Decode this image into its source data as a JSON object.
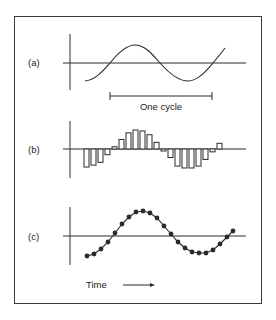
{
  "panels": {
    "a": {
      "label": "(a)",
      "description": "continuous sine wave"
    },
    "b": {
      "label": "(b)",
      "description": "sampled values as bars"
    },
    "c": {
      "label": "(c)",
      "description": "sampled values as dots on curve"
    }
  },
  "annotations": {
    "cycle_label": "One cycle",
    "time_label": "Time"
  },
  "colors": {
    "ink": "#2a2a2a",
    "frame": "#3a3a3a",
    "background": "#ffffff"
  },
  "bars_b": [
    -0.95,
    -0.85,
    -0.7,
    -0.3,
    0.12,
    0.5,
    0.85,
    1.0,
    0.95,
    0.75,
    0.35,
    -0.08,
    -0.45,
    -0.9,
    -1.0,
    -1.0,
    -0.9,
    -0.55,
    -0.15,
    0.3
  ],
  "dots_c": [
    [
      87,
      256
    ],
    [
      94,
      254
    ],
    [
      101,
      249
    ],
    [
      108,
      242
    ],
    [
      115,
      233
    ],
    [
      122,
      224
    ],
    [
      129,
      217
    ],
    [
      136,
      212
    ],
    [
      143,
      211
    ],
    [
      150,
      213
    ],
    [
      157,
      218
    ],
    [
      164,
      226
    ],
    [
      171,
      234
    ],
    [
      178,
      242
    ],
    [
      185,
      248
    ],
    [
      192,
      252
    ],
    [
      199,
      253
    ],
    [
      206,
      253
    ],
    [
      213,
      250
    ],
    [
      220,
      244
    ],
    [
      227,
      237
    ],
    [
      233,
      231
    ]
  ]
}
